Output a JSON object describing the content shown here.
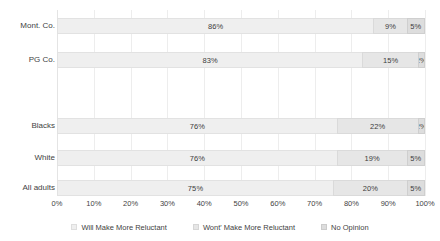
{
  "chart_data": {
    "type": "bar",
    "subtype": "stacked-horizontal-100",
    "title": "",
    "subtitle": "",
    "xlabel": "",
    "ylabel": "",
    "xlim": [
      0,
      100
    ],
    "grid": true,
    "legend_position": "bottom",
    "categories": [
      "Mont. Co.",
      "PG Co.",
      "",
      "Blacks",
      "White",
      "All adults"
    ],
    "xticks": [
      "0%",
      "10%",
      "20%",
      "30%",
      "40%",
      "50%",
      "60%",
      "70%",
      "80%",
      "90%",
      "100%"
    ],
    "xtick_values": [
      0,
      10,
      20,
      30,
      40,
      50,
      60,
      70,
      80,
      90,
      100
    ],
    "series": [
      {
        "name": "Will Make More Reluctant",
        "color": "#efefef",
        "values": [
          86,
          83,
          null,
          76,
          76,
          75
        ],
        "labels": [
          "86%",
          "83%",
          "",
          "76%",
          "76%",
          "75%"
        ]
      },
      {
        "name": "Wont' Make More Reluctant",
        "color": "#e6e6e6",
        "values": [
          9,
          15,
          null,
          22,
          19,
          20
        ],
        "labels": [
          "9%",
          "15%",
          "",
          "22%",
          "19%",
          "20%"
        ]
      },
      {
        "name": "No Opinion",
        "color": "#dddddd",
        "values": [
          5,
          2,
          null,
          2,
          5,
          5
        ],
        "labels": [
          "5%",
          "2%",
          "",
          "2%",
          "5%",
          "5%"
        ]
      }
    ],
    "rows": [
      {
        "category": "Mont. Co.",
        "segments": [
          {
            "series": "Will Make More Reluctant",
            "value": 86,
            "label": "86%"
          },
          {
            "series": "Wont' Make More Reluctant",
            "value": 9,
            "label": "9%"
          },
          {
            "series": "No Opinion",
            "value": 5,
            "label": "5%"
          }
        ]
      },
      {
        "category": "PG Co.",
        "segments": [
          {
            "series": "Will Make More Reluctant",
            "value": 83,
            "label": "83%"
          },
          {
            "series": "Wont' Make More Reluctant",
            "value": 15,
            "label": "15%"
          },
          {
            "series": "No Opinion",
            "value": 2,
            "label": "2%"
          }
        ]
      },
      {
        "category": "Blacks",
        "segments": [
          {
            "series": "Will Make More Reluctant",
            "value": 76,
            "label": "76%"
          },
          {
            "series": "Wont' Make More Reluctant",
            "value": 22,
            "label": "22%"
          },
          {
            "series": "No Opinion",
            "value": 2,
            "label": "2%"
          }
        ]
      },
      {
        "category": "White",
        "segments": [
          {
            "series": "Will Make More Reluctant",
            "value": 76,
            "label": "76%"
          },
          {
            "series": "Wont' Make More Reluctant",
            "value": 19,
            "label": "19%"
          },
          {
            "series": "No Opinion",
            "value": 5,
            "label": "5%"
          }
        ]
      },
      {
        "category": "All adults",
        "segments": [
          {
            "series": "Will Make More Reluctant",
            "value": 75,
            "label": "75%"
          },
          {
            "series": "Wont' Make More Reluctant",
            "value": 20,
            "label": "20%"
          },
          {
            "series": "No Opinion",
            "value": 5,
            "label": "5%"
          }
        ]
      }
    ]
  },
  "legend": {
    "items": [
      {
        "label": "Will Make More Reluctant",
        "color": "#efefef"
      },
      {
        "label": "Wont' Make More Reluctant",
        "color": "#e6e6e6"
      },
      {
        "label": "No Opinion",
        "color": "#dddddd"
      }
    ]
  }
}
